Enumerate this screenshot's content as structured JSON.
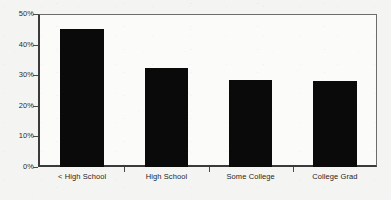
{
  "chart_data": {
    "type": "bar",
    "title": "",
    "subtitle": "",
    "xlabel": "",
    "ylabel": "",
    "categories": [
      "< High School",
      "High School",
      "Some College",
      "College Grad"
    ],
    "values": [
      45,
      32.5,
      28.5,
      28
    ],
    "series": [
      {
        "name": "",
        "values": [
          45,
          32.5,
          28.5,
          28
        ]
      }
    ],
    "ylim": [
      0,
      50
    ],
    "ytick_labels": [
      "0%",
      "10%",
      "20%",
      "30%",
      "40%",
      "50%"
    ],
    "ytick_values": [
      0,
      10,
      20,
      30,
      40,
      50
    ],
    "grid": false,
    "legend": false,
    "legend_position": "none",
    "bar_color": "#0a0a0a",
    "axis_color": "#3a3a3a",
    "frame_color": "#6d6d6d",
    "plot_background": "#fbfbfa",
    "figure_background": "#f4f4f2"
  }
}
